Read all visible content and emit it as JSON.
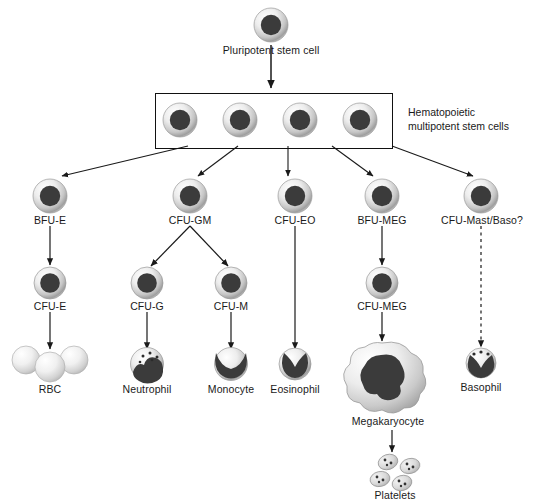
{
  "figure": {
    "background_color": "#ffffff",
    "line_color": "#1a1a1a",
    "nucleus_color": "#3b3b3b",
    "cytoplasm_light": "#f2f2f2",
    "cytoplasm_mid": "#c9c9c9"
  },
  "labels": {
    "pluripotent": "Pluripotent stem cell",
    "hematopoietic_line1": "Hematopoietic",
    "hematopoietic_line2": "multipotent stem cells",
    "bfu_e": "BFU-E",
    "cfu_gm": "CFU-GM",
    "cfu_eo": "CFU-EO",
    "bfu_meg": "BFU-MEG",
    "cfu_mast_baso": "CFU-Mast/Baso?",
    "cfu_e": "CFU-E",
    "cfu_g": "CFU-G",
    "cfu_m": "CFU-M",
    "cfu_meg": "CFU-MEG",
    "rbc": "RBC",
    "neutrophil": "Neutrophil",
    "monocyte": "Monocyte",
    "eosinophil": "Eosinophil",
    "megakaryocyte": "Megakaryocyte",
    "basophil": "Basophil",
    "platelets": "Platelets"
  },
  "lineages": [
    {
      "progenitor": "BFU-E",
      "intermediate": "CFU-E",
      "terminal": "RBC",
      "arrow_style": "solid"
    },
    {
      "progenitor": "CFU-GM",
      "intermediate": "CFU-G",
      "terminal": "Neutrophil",
      "arrow_style": "solid"
    },
    {
      "progenitor": "CFU-GM",
      "intermediate": "CFU-M",
      "terminal": "Monocyte",
      "arrow_style": "solid"
    },
    {
      "progenitor": "CFU-EO",
      "intermediate": null,
      "terminal": "Eosinophil",
      "arrow_style": "solid"
    },
    {
      "progenitor": "BFU-MEG",
      "intermediate": "CFU-MEG",
      "terminal": "Megakaryocyte",
      "arrow_style": "solid"
    },
    {
      "progenitor": "Megakaryocyte",
      "intermediate": null,
      "terminal": "Platelets",
      "arrow_style": "solid"
    },
    {
      "progenitor": "CFU-Mast/Baso?",
      "intermediate": null,
      "terminal": "Basophil",
      "arrow_style": "dashed"
    }
  ]
}
